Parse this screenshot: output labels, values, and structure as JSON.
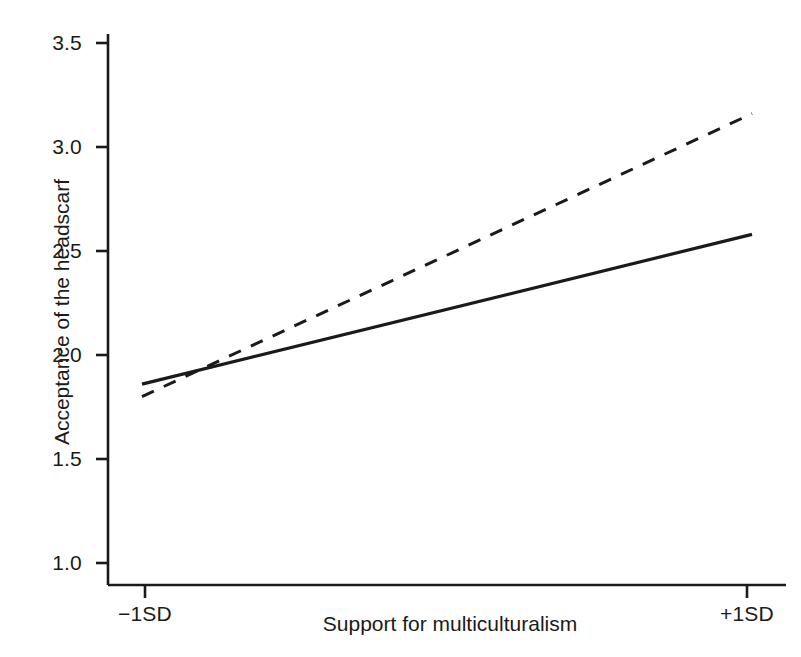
{
  "chart_data": {
    "type": "line",
    "title": "",
    "xlabel": "Support for multiculturalism",
    "ylabel": "Acceptance of the headscarf",
    "x": [
      "-1SD",
      "+1SD"
    ],
    "xtick_labels": [
      "−1SD",
      "+1SD"
    ],
    "ytick_labels": [
      "1.0",
      "1.5",
      "2.0",
      "2.5",
      "3.0",
      "3.5"
    ],
    "yticks": [
      1.0,
      1.5,
      2.0,
      2.5,
      3.0,
      3.5
    ],
    "ylim": [
      0.9,
      3.6
    ],
    "grid": false,
    "legend": "none",
    "series": [
      {
        "name": "solid-line",
        "style": "solid",
        "color": "#1a1a1a",
        "values": [
          1.86,
          2.58
        ]
      },
      {
        "name": "dashed-line",
        "style": "dashed",
        "color": "#1a1a1a",
        "values": [
          1.8,
          3.16
        ]
      }
    ],
    "annotations": []
  },
  "axis": {
    "y_labels": {
      "t35": "3.5",
      "t30": "3.0",
      "t25": "2.5",
      "t20": "2.0",
      "t15": "1.5",
      "t10": "1.0"
    },
    "x_labels": {
      "left": "−1SD",
      "right": "+1SD"
    },
    "x_title": "Support for multiculturalism",
    "y_title": "Acceptance of the headscarf"
  },
  "colors": {
    "ink": "#1a1a1a",
    "background": "#ffffff"
  }
}
